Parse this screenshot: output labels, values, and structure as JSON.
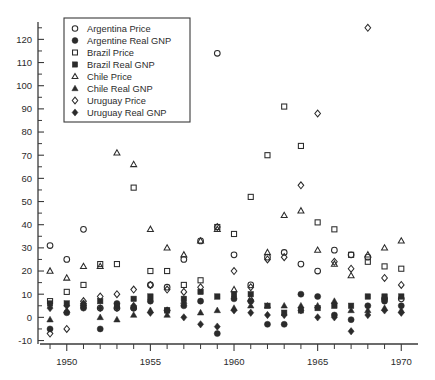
{
  "chart_data": {
    "type": "scatter",
    "title": "",
    "xlabel": "",
    "ylabel": "",
    "xlim": [
      1948.4,
      1971.0
    ],
    "ylim": [
      -11.5,
      127.5
    ],
    "grid": false,
    "legend_position": "top-left",
    "x_ticks_major": [
      1950,
      1955,
      1960,
      1965,
      1970
    ],
    "x_tick_labels": [
      "1950",
      "1955",
      "1960",
      "1965",
      "1970"
    ],
    "x_ticks_all": [
      1949,
      1950,
      1951,
      1952,
      1953,
      1954,
      1955,
      1956,
      1957,
      1958,
      1959,
      1960,
      1961,
      1962,
      1963,
      1964,
      1965,
      1966,
      1967,
      1968,
      1969,
      1970
    ],
    "y_ticks_major": [
      -10,
      0,
      10,
      20,
      30,
      40,
      50,
      60,
      70,
      80,
      90,
      100,
      110,
      120
    ],
    "y_tick_labels": [
      "-10",
      "0",
      "10",
      "20",
      "30",
      "40",
      "50",
      "60",
      "70",
      "80",
      "90",
      "100",
      "110",
      "120"
    ],
    "y_ticks_minor": [
      -5,
      5,
      15,
      25,
      35,
      45,
      55,
      65,
      75,
      85,
      95,
      105,
      115,
      125
    ],
    "series": [
      {
        "name": "Argentina Price",
        "marker": "circle-open",
        "x": [
          1949,
          1950,
          1951,
          1952,
          1953,
          1954,
          1955,
          1956,
          1957,
          1958,
          1959,
          1960,
          1961,
          1962,
          1963,
          1964,
          1965,
          1966,
          1967,
          1968,
          1969,
          1970
        ],
        "y": [
          31,
          25,
          38,
          4,
          4,
          4,
          14,
          13,
          25,
          33,
          114,
          27,
          14,
          26,
          28,
          23,
          20,
          29,
          27,
          26,
          8,
          8
        ]
      },
      {
        "name": "Argentine Real GNP",
        "marker": "circle-filled",
        "x": [
          1949,
          1950,
          1951,
          1952,
          1953,
          1954,
          1955,
          1956,
          1957,
          1958,
          1959,
          1960,
          1961,
          1962,
          1963,
          1964,
          1965,
          1966,
          1967,
          1968,
          1969,
          1970
        ],
        "y": [
          -5,
          2,
          4,
          -5,
          6,
          4,
          7,
          3,
          5,
          7,
          -7,
          8,
          7,
          -3,
          -3,
          10,
          9,
          1,
          -1,
          5,
          7,
          5
        ]
      },
      {
        "name": "Brazil Price",
        "marker": "square-open",
        "x": [
          1949,
          1950,
          1951,
          1952,
          1953,
          1954,
          1955,
          1956,
          1957,
          1958,
          1959,
          1960,
          1961,
          1962,
          1963,
          1964,
          1965,
          1966,
          1967,
          1968,
          1969,
          1970
        ],
        "y": [
          7,
          11,
          14,
          23,
          23,
          56,
          20,
          20,
          14,
          16,
          39,
          36,
          52,
          70,
          91,
          74,
          41,
          38,
          27,
          24,
          22,
          21
        ]
      },
      {
        "name": "Brazil Real GNP",
        "marker": "square-filled",
        "x": [
          1949,
          1950,
          1951,
          1952,
          1953,
          1954,
          1955,
          1956,
          1957,
          1958,
          1959,
          1960,
          1961,
          1962,
          1963,
          1964,
          1965,
          1966,
          1967,
          1968,
          1969,
          1970
        ],
        "y": [
          6,
          6,
          5,
          7,
          5,
          8,
          9,
          3,
          8,
          11,
          9,
          10,
          10,
          5,
          2,
          3,
          4,
          5,
          5,
          9,
          9,
          9
        ]
      },
      {
        "name": "Chile Price",
        "marker": "triangle-open",
        "x": [
          1949,
          1950,
          1951,
          1952,
          1953,
          1954,
          1955,
          1956,
          1957,
          1958,
          1959,
          1960,
          1961,
          1962,
          1963,
          1964,
          1965,
          1966,
          1967,
          1968,
          1969,
          1970
        ],
        "y": [
          20,
          17,
          22,
          22,
          71,
          66,
          38,
          30,
          27,
          33,
          38,
          12,
          8,
          28,
          44,
          46,
          29,
          23,
          18,
          27,
          30,
          33
        ]
      },
      {
        "name": "Chile Real GNP",
        "marker": "triangle-filled",
        "x": [
          1949,
          1950,
          1951,
          1952,
          1953,
          1954,
          1955,
          1956,
          1957,
          1958,
          1959,
          1960,
          1961,
          1962,
          1963,
          1964,
          1965,
          1966,
          1967,
          1968,
          1969,
          1970
        ],
        "y": [
          -1,
          3,
          6,
          0,
          -1,
          1,
          3,
          1,
          7,
          2,
          3,
          4,
          5,
          5,
          5,
          5,
          5,
          7,
          3,
          3,
          4,
          3
        ]
      },
      {
        "name": "Uruguay Price",
        "marker": "diamond-open",
        "x": [
          1949,
          1950,
          1951,
          1952,
          1953,
          1954,
          1955,
          1956,
          1957,
          1958,
          1959,
          1960,
          1961,
          1962,
          1963,
          1964,
          1965,
          1966,
          1967,
          1968,
          1969,
          1970
        ],
        "y": [
          -7,
          -5,
          7,
          9,
          10,
          12,
          14,
          12,
          11,
          13,
          39,
          20,
          13,
          25,
          26,
          57,
          88,
          24,
          21,
          125,
          17,
          14
        ]
      },
      {
        "name": "Uruguay Real GNP",
        "marker": "diamond-filled",
        "x": [
          1949,
          1950,
          1951,
          1952,
          1953,
          1954,
          1955,
          1956,
          1957,
          1958,
          1959,
          1960,
          1961,
          1962,
          1963,
          1964,
          1965,
          1966,
          1967,
          1968,
          1969,
          1970
        ],
        "y": [
          4,
          5,
          6,
          4,
          4,
          5,
          2,
          3,
          0,
          -3,
          -4,
          3,
          2,
          1,
          1,
          3,
          0,
          0,
          -6,
          1,
          3,
          2
        ]
      }
    ]
  },
  "legend": {
    "items": [
      {
        "label": "Argentina Price",
        "marker": "circle-open"
      },
      {
        "label": "Argentine Real GNP",
        "marker": "circle-filled"
      },
      {
        "label": "Brazil Price",
        "marker": "square-open"
      },
      {
        "label": "Brazil Real GNP",
        "marker": "square-filled"
      },
      {
        "label": "Chile Price",
        "marker": "triangle-open"
      },
      {
        "label": "Chile Real GNP",
        "marker": "triangle-filled"
      },
      {
        "label": "Uruguay Price",
        "marker": "diamond-open"
      },
      {
        "label": "Uruguay Real GNP",
        "marker": "diamond-filled"
      }
    ]
  }
}
